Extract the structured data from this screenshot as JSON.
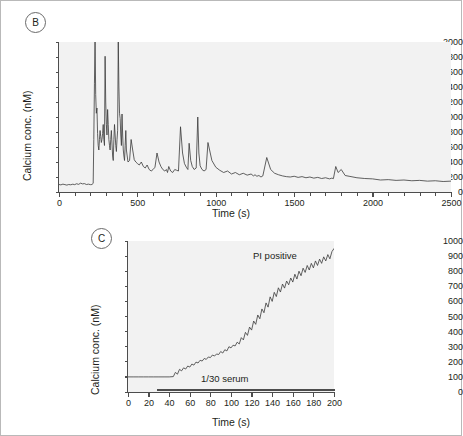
{
  "figure": {
    "panels": [
      {
        "id": "B",
        "label": "B"
      },
      {
        "id": "C",
        "label": "C"
      }
    ]
  },
  "chart_data": [
    {
      "id": "panel-b",
      "panel_label": "B",
      "type": "line",
      "title": "",
      "xlabel": "Time (s)",
      "ylabel": "Calcium conc. (nM)",
      "xlim": [
        0,
        2500
      ],
      "ylim": [
        0,
        2000
      ],
      "xticks": [
        0,
        500,
        1000,
        1500,
        2000,
        2500
      ],
      "xtick_labels": [
        "0",
        "500",
        "1000",
        "1500",
        "2000",
        "2500"
      ],
      "x_minor_tick_step": 100,
      "yticks": [
        0,
        200,
        400,
        600,
        800,
        1000,
        1200,
        1400,
        1600,
        1800,
        2000
      ],
      "ytick_labels": [
        "0",
        "200",
        "400",
        "600",
        "800",
        "1000",
        "1200",
        "1400",
        "1600",
        "1800",
        "2000"
      ],
      "grid": false,
      "legend": "none",
      "series": [
        {
          "name": "Calcium concentration",
          "color": "#3a3a3a",
          "x": [
            0,
            12,
            25,
            38,
            50,
            62,
            75,
            88,
            100,
            112,
            125,
            138,
            150,
            162,
            175,
            188,
            200,
            210,
            218,
            222,
            226,
            230,
            234,
            238,
            242,
            246,
            250,
            254,
            258,
            262,
            266,
            270,
            274,
            278,
            282,
            286,
            290,
            294,
            298,
            302,
            306,
            310,
            314,
            318,
            322,
            326,
            330,
            334,
            338,
            342,
            346,
            350,
            354,
            358,
            362,
            366,
            370,
            374,
            378,
            382,
            386,
            390,
            394,
            398,
            402,
            406,
            410,
            414,
            418,
            422,
            426,
            430,
            440,
            450,
            460,
            470,
            480,
            490,
            500,
            512,
            525,
            538,
            550,
            562,
            575,
            588,
            600,
            612,
            625,
            638,
            650,
            662,
            675,
            685,
            692,
            700,
            712,
            725,
            738,
            750,
            762,
            775,
            788,
            800,
            812,
            822,
            830,
            840,
            850,
            862,
            875,
            885,
            892,
            900,
            912,
            925,
            938,
            950,
            975,
            1000,
            1025,
            1050,
            1075,
            1100,
            1125,
            1150,
            1175,
            1200,
            1225,
            1240,
            1250,
            1262,
            1275,
            1288,
            1300,
            1325,
            1350,
            1375,
            1400,
            1425,
            1450,
            1475,
            1500,
            1525,
            1550,
            1575,
            1600,
            1625,
            1650,
            1675,
            1700,
            1725,
            1740,
            1750,
            1765,
            1780,
            1800,
            1825,
            1850,
            1875,
            1900,
            1950,
            2000,
            2050,
            2100,
            2150,
            2200,
            2250,
            2300,
            2350,
            2400,
            2450,
            2500
          ],
          "y": [
            100,
            95,
            105,
            98,
            92,
            100,
            96,
            104,
            98,
            110,
            102,
            118,
            108,
            112,
            100,
            105,
            98,
            100,
            115,
            700,
            1450,
            2050,
            1300,
            1050,
            1120,
            780,
            620,
            560,
            700,
            820,
            740,
            660,
            700,
            780,
            900,
            700,
            620,
            1810,
            1200,
            900,
            760,
            1100,
            900,
            700,
            620,
            560,
            700,
            820,
            640,
            480,
            420,
            700,
            900,
            760,
            620,
            540,
            700,
            820,
            2020,
            1400,
            1050,
            980,
            760,
            620,
            1040,
            760,
            560,
            480,
            420,
            620,
            820,
            560,
            400,
            420,
            700,
            560,
            430,
            400,
            380,
            360,
            400,
            340,
            320,
            360,
            300,
            280,
            300,
            330,
            520,
            400,
            340,
            300,
            280,
            300,
            260,
            340,
            280,
            260,
            300,
            290,
            280,
            870,
            520,
            380,
            330,
            300,
            650,
            420,
            340,
            300,
            320,
            1000,
            520,
            350,
            300,
            280,
            300,
            660,
            420,
            330,
            290,
            260,
            280,
            240,
            260,
            230,
            250,
            225,
            240,
            215,
            230,
            210,
            220,
            200,
            215,
            460,
            300,
            250,
            230,
            215,
            205,
            200,
            210,
            195,
            205,
            190,
            200,
            185,
            195,
            180,
            190,
            175,
            185,
            178,
            340,
            260,
            300,
            220,
            210,
            200,
            190,
            180,
            175,
            160,
            165,
            155,
            160,
            150,
            155,
            145,
            150,
            140,
            145,
            138
          ]
        }
      ]
    },
    {
      "id": "panel-c",
      "panel_label": "C",
      "type": "line",
      "title": "",
      "xlabel": "Time (s)",
      "ylabel": "Calcium conc. (nM)",
      "xlim": [
        0,
        200
      ],
      "ylim": [
        0,
        1000
      ],
      "xticks": [
        0,
        20,
        40,
        60,
        80,
        100,
        120,
        140,
        160,
        180,
        200
      ],
      "xtick_labels": [
        "0",
        "20",
        "40",
        "60",
        "80",
        "100",
        "120",
        "140",
        "160",
        "180",
        "200"
      ],
      "yticks": [
        0,
        100,
        200,
        300,
        400,
        500,
        600,
        700,
        800,
        900,
        1000
      ],
      "ytick_labels": [
        "0",
        "100",
        "200",
        "300",
        "400",
        "500",
        "600",
        "700",
        "800",
        "900",
        "1000"
      ],
      "grid": false,
      "legend": "none",
      "annotations": [
        {
          "text": "PI positive",
          "x": 128,
          "y": 880
        },
        {
          "text": "1/30 serum",
          "x": 72,
          "y": 110
        }
      ],
      "treatment_bar": {
        "label": "1/30 serum",
        "x_start": 28,
        "x_end": 200,
        "y": 40
      },
      "series": [
        {
          "name": "Calcium concentration",
          "color": "#3a3a3a",
          "x": [
            0,
            5,
            10,
            15,
            20,
            25,
            30,
            35,
            40,
            44,
            46,
            48,
            50,
            52,
            54,
            56,
            58,
            60,
            62,
            64,
            66,
            68,
            70,
            72,
            74,
            76,
            78,
            80,
            82,
            84,
            86,
            88,
            90,
            92,
            94,
            96,
            98,
            100,
            102,
            104,
            106,
            108,
            110,
            112,
            114,
            116,
            118,
            120,
            122,
            124,
            126,
            128,
            130,
            132,
            134,
            136,
            138,
            140,
            142,
            144,
            146,
            148,
            150,
            152,
            154,
            156,
            158,
            160,
            162,
            164,
            166,
            168,
            170,
            172,
            174,
            176,
            178,
            180,
            182,
            184,
            186,
            188,
            190,
            192,
            194,
            196,
            198,
            200
          ],
          "y": [
            100,
            100,
            100,
            100,
            100,
            100,
            100,
            100,
            100,
            102,
            130,
            118,
            150,
            140,
            160,
            152,
            172,
            165,
            185,
            178,
            198,
            192,
            210,
            205,
            222,
            216,
            232,
            228,
            245,
            238,
            252,
            248,
            268,
            258,
            280,
            272,
            300,
            292,
            310,
            305,
            330,
            318,
            360,
            345,
            395,
            375,
            430,
            410,
            470,
            448,
            510,
            485,
            550,
            525,
            590,
            562,
            630,
            600,
            660,
            632,
            690,
            662,
            715,
            688,
            735,
            710,
            755,
            728,
            780,
            748,
            800,
            770,
            820,
            792,
            838,
            808,
            852,
            822,
            868,
            838,
            880,
            852,
            895,
            868,
            910,
            882,
            930,
            950
          ]
        }
      ]
    }
  ]
}
